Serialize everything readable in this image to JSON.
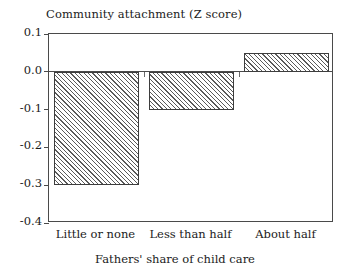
{
  "chart_data": {
    "type": "bar",
    "title": "Community attachment (Z score)",
    "xlabel": "Fathers' share of child care",
    "ylabel": "Community attachment (Z score)",
    "categories": [
      "Little or none",
      "Less than half",
      "About half"
    ],
    "values": [
      -0.3,
      -0.1,
      0.05
    ],
    "ylim": [
      -0.4,
      0.1
    ],
    "yticks": [
      "0.1",
      "0.0",
      "-0.1",
      "-0.2",
      "-0.3",
      "-0.4"
    ],
    "ytick_values": [
      0.1,
      0.0,
      -0.1,
      -0.2,
      -0.3,
      -0.4
    ],
    "grid": false,
    "legend": null,
    "bar_fill": "diagonal-hatch",
    "bar_edge_color": "#3d3d3d",
    "hatch_color": "#5a5a5a",
    "axis_color": "#4a4a4a",
    "background": "#ffffff"
  },
  "axis": {
    "yticks": [
      {
        "label": "0.1",
        "value": 0.1
      },
      {
        "label": "0.0",
        "value": 0.0
      },
      {
        "label": "-0.1",
        "value": -0.1
      },
      {
        "label": "-0.2",
        "value": -0.2
      },
      {
        "label": "-0.3",
        "value": -0.3
      },
      {
        "label": "-0.4",
        "value": -0.4
      }
    ]
  },
  "bars": [
    {
      "category": "Little or none",
      "value": -0.3
    },
    {
      "category": "Less than half",
      "value": -0.1
    },
    {
      "category": "About half",
      "value": 0.05
    }
  ]
}
